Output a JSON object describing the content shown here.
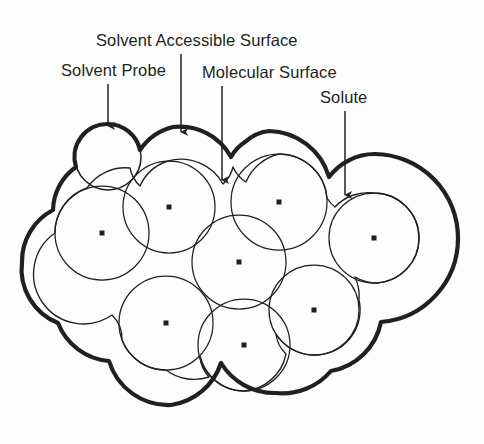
{
  "figure": {
    "background_color": "#fdfdfd",
    "ink_color": "#231f20"
  },
  "labels": {
    "solvent_probe": "Solvent Probe",
    "solvent_accessible_surface": "Solvent Accessible Surface",
    "molecular_surface": "Molecular Surface",
    "solute": "Solute"
  },
  "annotations": [
    {
      "name": "solvent-probe",
      "text": "Solvent Probe",
      "text_x": 61,
      "text_y": 61,
      "arrow_x": 108,
      "arrow_y0": 84,
      "arrow_y1": 128
    },
    {
      "name": "solvent-accessible-surface",
      "text": "Solvent Accessible Surface",
      "text_x": 96,
      "text_y": 31,
      "arrow_x": 181,
      "arrow_y0": 54,
      "arrow_y1": 134
    },
    {
      "name": "molecular-surface",
      "text": "Molecular Surface",
      "text_x": 202,
      "text_y": 63,
      "arrow_x": 222,
      "arrow_y0": 86,
      "arrow_y1": 182
    },
    {
      "name": "solute",
      "text": "Solute",
      "text_x": 320,
      "text_y": 88,
      "arrow_x": 345,
      "arrow_y0": 111,
      "arrow_y1": 197
    }
  ],
  "geometry": {
    "probe_radius": 33,
    "solvent_probe_circle": {
      "cx": 108,
      "cy": 157,
      "r": 33
    },
    "atoms": [
      {
        "id": "atom-1",
        "cx": 102,
        "cy": 233,
        "r": 47
      },
      {
        "id": "atom-2",
        "cx": 169,
        "cy": 207,
        "r": 46
      },
      {
        "id": "atom-3",
        "cx": 279,
        "cy": 202,
        "r": 48
      },
      {
        "id": "atom-4",
        "cx": 239,
        "cy": 262,
        "r": 47
      },
      {
        "id": "atom-5",
        "cx": 374,
        "cy": 238,
        "r": 45
      },
      {
        "id": "atom-6",
        "cx": 166,
        "cy": 323,
        "r": 47
      },
      {
        "id": "atom-7",
        "cx": 244,
        "cy": 345,
        "r": 46
      },
      {
        "id": "atom-8",
        "cx": 314,
        "cy": 310,
        "r": 45
      }
    ],
    "bounds": {
      "left": 22,
      "right": 457,
      "top": 120,
      "bottom": 410
    }
  },
  "styles": {
    "outer_stroke_width": 4.2,
    "inner_stroke_width": 1.3,
    "center_dot_size": 5
  }
}
